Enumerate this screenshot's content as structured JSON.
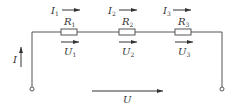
{
  "diagram": {
    "type": "series-circuit",
    "total_current": {
      "symbol": "I"
    },
    "total_voltage": {
      "symbol": "U"
    },
    "resistors": [
      {
        "name": "R",
        "sub": "1",
        "current": "I",
        "current_sub": "1",
        "voltage": "U",
        "voltage_sub": "1"
      },
      {
        "name": "R",
        "sub": "2",
        "current": "I",
        "current_sub": "2",
        "voltage": "U",
        "voltage_sub": "2"
      },
      {
        "name": "R",
        "sub": "3",
        "current": "I",
        "current_sub": "3",
        "voltage": "U",
        "voltage_sub": "3"
      }
    ],
    "colors": {
      "line": "#555555",
      "text": "#333333",
      "background": "#ffffff"
    }
  }
}
